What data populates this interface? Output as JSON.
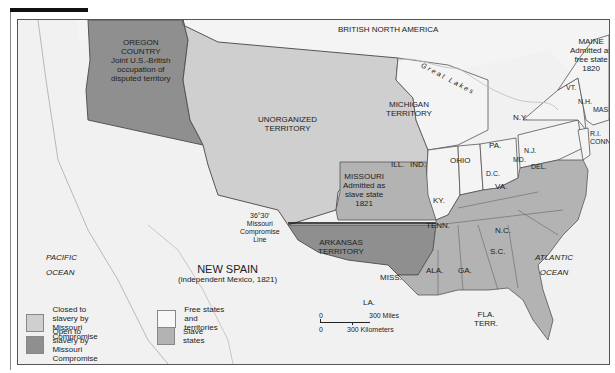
{
  "map": {
    "title_region": "BRITISH NORTH AMERICA",
    "colors": {
      "closed_to_slavery": "#cfcfcf",
      "open_to_slavery": "#8f8f8f",
      "free_states": "#f4f4f4",
      "slave_states": "#b3b3b3",
      "water": "#f1f1f1",
      "border": "#555555"
    },
    "regions": {
      "oregon": {
        "name": "OREGON",
        "name2": "COUNTRY",
        "note1": "Joint U.S.-British",
        "note2": "occupation of",
        "note3": "disputed territory"
      },
      "unorganized": {
        "name": "UNORGANIZED",
        "name2": "TERRITORY"
      },
      "michigan": {
        "name": "MICHIGAN",
        "name2": "TERRITORY"
      },
      "maine": {
        "name": "MAINE",
        "note1": "Admitted as",
        "note2": "free state",
        "note3": "1820"
      },
      "missouri": {
        "name": "MISSOURI",
        "note1": "Admitted as",
        "note2": "slave state",
        "note3": "1821"
      },
      "arkansas": {
        "name": "ARKANSAS",
        "name2": "TERRITORY"
      },
      "new_spain": {
        "name": "NEW SPAIN",
        "note": "(independent Mexico, 1821)"
      },
      "pacific": {
        "name": "PACIFIC",
        "name2": "OCEAN"
      },
      "atlantic": {
        "name": "ATLANTIC",
        "name2": "OCEAN"
      },
      "great_lakes": "Great Lakes",
      "compromise_line": {
        "deg": "36°30'",
        "l1": "Missouri",
        "l2": "Compromise",
        "l3": "Line"
      }
    },
    "states": {
      "vt": "VT.",
      "nh": "N.H.",
      "mass": "MASS.",
      "ri": "R.I.",
      "conn": "CONN.",
      "ny": "N.Y.",
      "nj": "N.J.",
      "pa": "PA.",
      "del": "DEL.",
      "md": "MD.",
      "dc": "D.C.",
      "va": "VA.",
      "ohio": "OHIO",
      "ind": "IND.",
      "ill": "ILL.",
      "ky": "KY.",
      "tenn": "TENN.",
      "nc": "N.C.",
      "sc": "S.C.",
      "ga": "GA.",
      "ala": "ALA.",
      "miss": "MISS.",
      "la": "LA.",
      "fla": "FLA.",
      "fla2": "TERR."
    },
    "legend": [
      {
        "label1": "Closed to slavery by",
        "label2": "Missouri Compromise"
      },
      {
        "label1": "Open to slavery by",
        "label2": "Missouri Compromise"
      },
      {
        "label1": "Free states and",
        "label2": "territories"
      },
      {
        "label1": "Slave states",
        "label2": ""
      }
    ],
    "scale": {
      "zero_top": "0",
      "miles": "300 Miles",
      "zero_bottom": "0",
      "km": "300 Kilometers"
    }
  }
}
